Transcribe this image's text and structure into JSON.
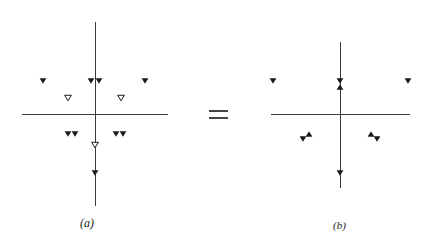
{
  "figure": {
    "operator": "=",
    "panels": [
      {
        "id": "a",
        "caption": "(a)",
        "axes": {
          "cx": 95,
          "cy": 114,
          "x_from": 22,
          "x_to": 168,
          "y_from": 22,
          "y_to": 206
        },
        "markers": [
          {
            "x": 43,
            "y": 81,
            "shape": "down",
            "fill": "filled"
          },
          {
            "x": 91,
            "y": 81,
            "shape": "down",
            "fill": "filled"
          },
          {
            "x": 99,
            "y": 81,
            "shape": "down",
            "fill": "filled"
          },
          {
            "x": 145,
            "y": 81,
            "shape": "down",
            "fill": "filled"
          },
          {
            "x": 68,
            "y": 98,
            "shape": "down",
            "fill": "open"
          },
          {
            "x": 121,
            "y": 98,
            "shape": "down",
            "fill": "open"
          },
          {
            "x": 68,
            "y": 134,
            "shape": "down",
            "fill": "filled"
          },
          {
            "x": 75,
            "y": 134,
            "shape": "down",
            "fill": "filled"
          },
          {
            "x": 116,
            "y": 134,
            "shape": "down",
            "fill": "filled"
          },
          {
            "x": 123,
            "y": 134,
            "shape": "down",
            "fill": "filled"
          },
          {
            "x": 95,
            "y": 145,
            "shape": "down",
            "fill": "open"
          },
          {
            "x": 95,
            "y": 173,
            "shape": "down",
            "fill": "filled"
          }
        ]
      },
      {
        "id": "b",
        "caption": "(b)",
        "axes": {
          "cx": 340,
          "cy": 114,
          "x_from": 271,
          "x_to": 410,
          "y_from": 42,
          "y_to": 188
        },
        "markers": [
          {
            "x": 273,
            "y": 81,
            "shape": "down",
            "fill": "filled"
          },
          {
            "x": 340,
            "y": 81,
            "shape": "down",
            "fill": "filled"
          },
          {
            "x": 340,
            "y": 87,
            "shape": "up",
            "fill": "filled"
          },
          {
            "x": 408,
            "y": 81,
            "shape": "down",
            "fill": "filled"
          },
          {
            "x": 303,
            "y": 139,
            "shape": "down",
            "fill": "filled"
          },
          {
            "x": 309,
            "y": 134,
            "shape": "up",
            "fill": "filled"
          },
          {
            "x": 371,
            "y": 134,
            "shape": "up",
            "fill": "filled"
          },
          {
            "x": 377,
            "y": 139,
            "shape": "down",
            "fill": "filled"
          },
          {
            "x": 340,
            "y": 173,
            "shape": "down",
            "fill": "filled"
          }
        ]
      }
    ]
  }
}
